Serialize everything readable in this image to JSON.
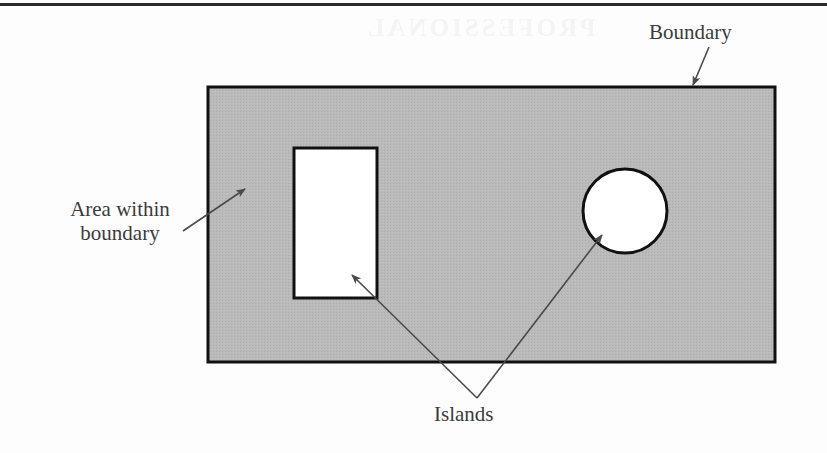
{
  "page": {
    "width": 827,
    "height": 453,
    "background_color": "#fdfdfd",
    "rule_color": "#2a2a2a",
    "watermark_text": "PROFESSIONAL"
  },
  "diagram": {
    "colors": {
      "fill_gray": "#b8b8b8",
      "outline": "#111111",
      "island_fill": "#ffffff",
      "leader_line": "#4a4a4a",
      "text": "#3b3b3b"
    },
    "shapes": {
      "boundary_rect": {
        "name": "boundary-rectangle",
        "x": 208,
        "y": 87,
        "width": 567,
        "height": 275,
        "fill": "#b8b8b8",
        "stroke": "#111111",
        "stroke_width": 3
      },
      "island_rect": {
        "name": "rectangular-island",
        "x": 294,
        "y": 148,
        "width": 83,
        "height": 150,
        "fill": "#ffffff",
        "stroke": "#111111",
        "stroke_width": 3
      },
      "island_circle": {
        "name": "circular-island",
        "cx": 625,
        "cy": 211,
        "r": 42,
        "fill": "#ffffff",
        "stroke": "#111111",
        "stroke_width": 3
      }
    }
  },
  "labels": {
    "boundary": {
      "text": "Boundary",
      "font_size": 21,
      "arrow_from": [
        709,
        47
      ],
      "arrow_to": [
        691,
        87
      ]
    },
    "area_within_boundary": {
      "text": "Area within boundary",
      "line1": "Area within",
      "line2": "boundary",
      "font_size": 21,
      "arrow_from": [
        183,
        231
      ],
      "arrow_to": [
        247,
        188
      ]
    },
    "islands": {
      "text": "Islands",
      "font_size": 21,
      "junction": [
        477,
        398
      ],
      "arrow_to_rect": [
        350,
        273
      ],
      "arrow_to_circle": [
        600,
        233
      ]
    }
  }
}
